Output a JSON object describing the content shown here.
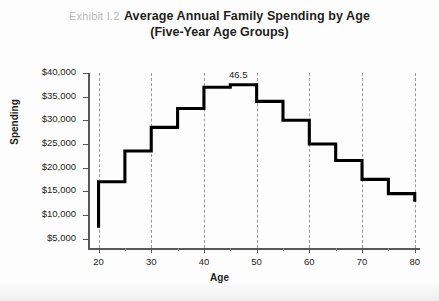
{
  "header": {
    "exhibit_label": "Exhibit I.2",
    "title_line1": "Average Annual Family Spending by Age",
    "title_line2": "(Five-Year Age Groups)"
  },
  "colors": {
    "line": "#000000",
    "axis": "#58585a",
    "grid": "#9a9a9a",
    "text": "#231f20",
    "exhibit_label": "#b9b9b9",
    "background": "#fdfdfd"
  },
  "chart_data": {
    "type": "line",
    "subtype": "step",
    "title": "Average Annual Family Spending by Age (Five-Year Age Groups)",
    "xlabel": "Age",
    "ylabel": "Spending",
    "xlim": [
      18,
      81
    ],
    "ylim": [
      3000,
      40000
    ],
    "grid": true,
    "grid_axis": "x",
    "legend": "none",
    "x_ticks": [
      20,
      30,
      40,
      50,
      60,
      70,
      80
    ],
    "x_tick_labels": [
      "20",
      "30",
      "40",
      "50",
      "60",
      "70",
      "80"
    ],
    "x_minor_ticks": [
      25,
      35,
      45,
      55,
      65,
      75
    ],
    "y_ticks": [
      5000,
      10000,
      15000,
      20000,
      25000,
      30000,
      35000,
      40000
    ],
    "y_tick_labels": [
      "$5,000",
      "$10,000",
      "$15,000",
      "$20,000",
      "$25,000",
      "$30,000",
      "$35,000",
      "$40,000"
    ],
    "categories": [
      "20-25",
      "25-30",
      "30-35",
      "35-40",
      "40-45",
      "45-50",
      "50-55",
      "55-60",
      "60-65",
      "65-70",
      "70-75",
      "75-80"
    ],
    "bin_edges": [
      20,
      25,
      30,
      35,
      40,
      45,
      50,
      55,
      60,
      65,
      70,
      75,
      80
    ],
    "values": [
      17000,
      23500,
      28500,
      32500,
      37000,
      37500,
      34000,
      30000,
      25000,
      21500,
      17500,
      14500
    ],
    "start_value": 7300,
    "end_value": 12800,
    "annotations": [
      {
        "text": "46.5",
        "x": 46.5,
        "y": 39500,
        "note": "peak spending age"
      }
    ]
  }
}
